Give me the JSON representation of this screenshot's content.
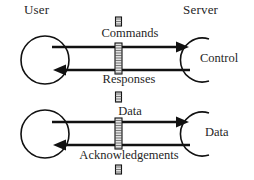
{
  "diagram": {
    "type": "sequence-style block diagram",
    "columns": {
      "left_header": "User",
      "right_header": "Server"
    },
    "colors": {
      "stroke": "#111111",
      "text": "#1f1f1f",
      "barrier_fill": "#e2e2e2",
      "background": "#ffffff"
    },
    "groups": [
      {
        "id": "control",
        "left_node": {
          "label": "",
          "shape": "circle"
        },
        "right_node": {
          "label": "Control",
          "shape": "open-arc"
        },
        "flows": [
          {
            "label": "Commands",
            "direction": "left-to-right"
          },
          {
            "label": "Responses",
            "direction": "right-to-left"
          }
        ]
      },
      {
        "id": "data",
        "left_node": {
          "label": "",
          "shape": "circle"
        },
        "right_node": {
          "label": "Data",
          "shape": "open-arc"
        },
        "flows": [
          {
            "label": "Data",
            "direction": "left-to-right"
          },
          {
            "label": "Acknowledgements",
            "direction": "right-to-left"
          }
        ]
      }
    ],
    "barrier": {
      "name": "boundary-bar",
      "style": "hatched vertical bar",
      "segments": 4
    }
  }
}
